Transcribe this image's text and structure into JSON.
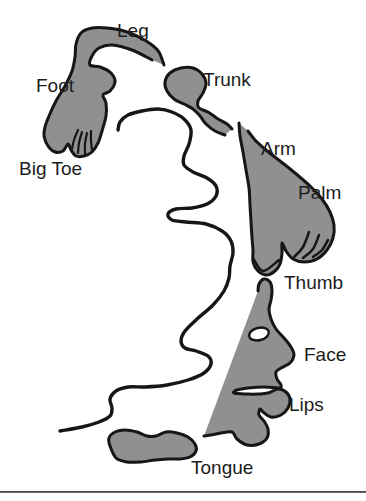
{
  "figure": {
    "kind": "cortical-homunculus-body-map-diagram"
  },
  "labels": {
    "leg": "Leg",
    "foot": "Foot",
    "big_toe": "Big Toe",
    "trunk": "Trunk",
    "arm": "Arm",
    "palm": "Palm",
    "thumb": "Thumb",
    "face": "Face",
    "lips": "Lips",
    "tongue": "Tongue"
  },
  "colors": {
    "region_fill": "#909090",
    "outline": "#161616",
    "label_text": "#1c1c1c",
    "background": "#ffffff",
    "eye_fill": "#ffffff",
    "bottom_rule": "#474747"
  }
}
